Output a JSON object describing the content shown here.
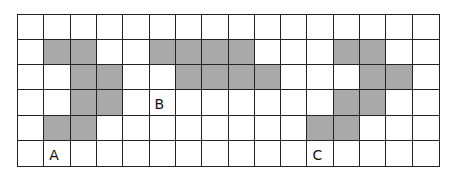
{
  "grid": {
    "rows": 6,
    "cols": 16,
    "shade_color": "#a9a9a9",
    "shapes": [
      {
        "label": "A",
        "label_cell": [
          5,
          1
        ],
        "cells": [
          [
            1,
            1
          ],
          [
            1,
            2
          ],
          [
            2,
            2
          ],
          [
            2,
            3
          ],
          [
            3,
            2
          ],
          [
            3,
            3
          ],
          [
            4,
            1
          ],
          [
            4,
            2
          ]
        ]
      },
      {
        "label": "B",
        "label_cell": [
          3,
          5
        ],
        "cells": [
          [
            1,
            5
          ],
          [
            1,
            6
          ],
          [
            1,
            7
          ],
          [
            1,
            8
          ],
          [
            2,
            6
          ],
          [
            2,
            7
          ],
          [
            2,
            8
          ],
          [
            2,
            9
          ]
        ]
      },
      {
        "label": "C",
        "label_cell": [
          5,
          11
        ],
        "cells": [
          [
            1,
            12
          ],
          [
            1,
            13
          ],
          [
            2,
            13
          ],
          [
            2,
            14
          ],
          [
            3,
            12
          ],
          [
            3,
            13
          ],
          [
            4,
            11
          ],
          [
            4,
            12
          ]
        ]
      }
    ]
  }
}
